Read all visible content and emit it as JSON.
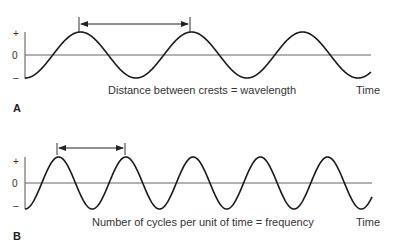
{
  "panels": [
    {
      "id": "A",
      "label": "A",
      "caption": "Distance between crests = wavelength",
      "x_axis_label": "Time",
      "y_ticks": {
        "plus": "+",
        "zero": "0",
        "minus": "–"
      },
      "wave": {
        "x_start": 25,
        "x_end": 371,
        "period_px": 111,
        "baseline_y": 55,
        "amplitude_px": 23,
        "start_phase": "trough"
      },
      "arrow": {
        "from_x": 79,
        "to_x": 190,
        "y": 24,
        "tick_top": 17,
        "tick_bottom": 32,
        "meaning": "wavelength (crest to crest)"
      }
    },
    {
      "id": "B",
      "label": "B",
      "caption": "Number of cycles per unit of time = frequency",
      "x_axis_label": "Time",
      "y_ticks": {
        "plus": "+",
        "zero": "0",
        "minus": "–"
      },
      "wave": {
        "x_start": 25,
        "x_end": 372,
        "period_px": 67.25,
        "baseline_y": 183,
        "amplitude_px": 26,
        "start_phase": "trough"
      },
      "arrow": {
        "from_x": 57,
        "to_x": 125,
        "y": 148,
        "tick_top": 143,
        "tick_bottom": 155,
        "meaning": "one cycle"
      }
    }
  ],
  "colors": {
    "wave": "#1a1a1a",
    "axis": "#555555",
    "text": "#333333"
  }
}
